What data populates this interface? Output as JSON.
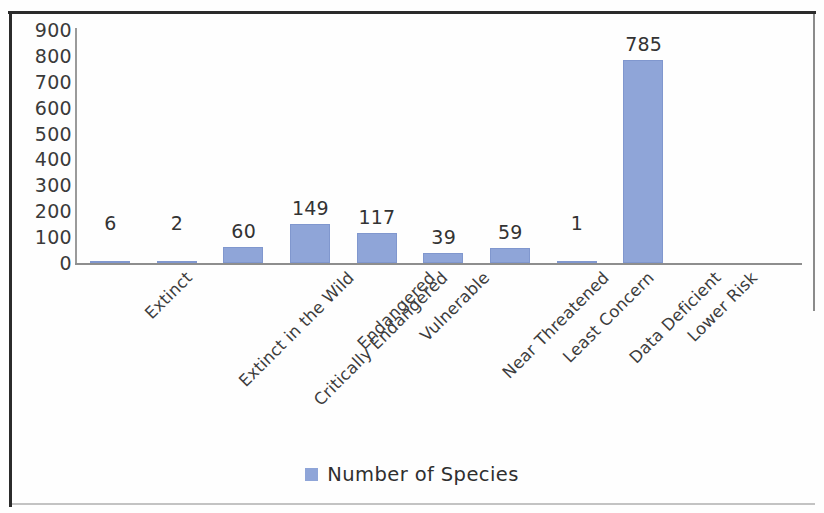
{
  "chart_data": {
    "type": "bar",
    "title": "",
    "xlabel": "",
    "ylabel": "",
    "categories": [
      "Extinct",
      "Extinct in the Wild",
      "Critically Endangered",
      "Endangered",
      "Vulnerable",
      "Near Threatened",
      "Least Concern",
      "Data Deficient",
      "Lower Risk"
    ],
    "values": [
      6,
      2,
      60,
      149,
      117,
      39,
      59,
      1,
      785
    ],
    "series": [
      {
        "name": "Number of Species",
        "values": [
          6,
          2,
          60,
          149,
          117,
          39,
          59,
          1,
          785
        ]
      }
    ],
    "data_labels": [
      "6",
      "2",
      "60",
      "149",
      "117",
      "39",
      "59",
      "1",
      "785"
    ],
    "ylim": [
      0,
      900
    ],
    "ytick_labels": [
      "900",
      "800",
      "700",
      "600",
      "500",
      "400",
      "300",
      "200",
      "100",
      "0"
    ],
    "ytick_values": [
      900,
      800,
      700,
      600,
      500,
      400,
      300,
      200,
      100,
      0
    ],
    "grid": false,
    "legend_position": "bottom",
    "bar_color": "#8FA5D8",
    "axis_color": "#8E8E8E",
    "text_color": "#333333",
    "xlabel_rotation_deg": -45
  },
  "legend": {
    "series_label": "Number of Species",
    "swatch_icon": "square-swatch-icon"
  }
}
